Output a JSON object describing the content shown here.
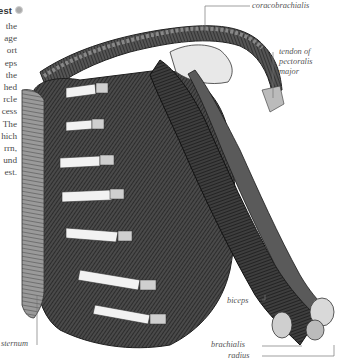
{
  "heading": {
    "text": "est",
    "bullet_icon": "grey-dot"
  },
  "body_text": {
    "lines": [
      "the",
      "age",
      "ort",
      "eps",
      "the",
      "hed",
      "rcle",
      "cess",
      "The",
      "hich",
      "rrn,",
      "und",
      "est."
    ]
  },
  "figure": {
    "labels": {
      "coracobrachialis": "coracobrachialis",
      "tendon_line1": "tendon of",
      "tendon_line2": "pectoralis",
      "tendon_line3": "major",
      "sternum": "sternum",
      "biceps": "biceps",
      "brachialis": "brachialis",
      "radius": "radius"
    }
  }
}
